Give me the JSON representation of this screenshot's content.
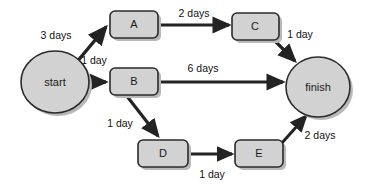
{
  "diagram": {
    "type": "activity-network-diagram",
    "title": "",
    "colors": {
      "node_fill": "#d2d2d2",
      "node_stroke": "#2b2b2b",
      "edge": "#232323",
      "shadow": "#b9b9b9",
      "background": "#ffffff",
      "text": "#1a1a1a"
    },
    "nodes": [
      {
        "id": "start",
        "label": "start",
        "shape": "ellipse",
        "cx": 55,
        "cy": 82,
        "rx": 34,
        "ry": 31
      },
      {
        "id": "A",
        "label": "A",
        "shape": "rounded-rect",
        "x": 110,
        "y": 11,
        "w": 48,
        "h": 27
      },
      {
        "id": "B",
        "label": "B",
        "shape": "rounded-rect",
        "x": 110,
        "y": 68,
        "w": 48,
        "h": 27
      },
      {
        "id": "C",
        "label": "C",
        "shape": "rounded-rect",
        "x": 232,
        "y": 13,
        "w": 47,
        "h": 27
      },
      {
        "id": "D",
        "label": "D",
        "shape": "rounded-rect",
        "x": 138,
        "y": 140,
        "w": 50,
        "h": 27
      },
      {
        "id": "E",
        "label": "E",
        "shape": "rounded-rect",
        "x": 235,
        "y": 140,
        "w": 48,
        "h": 27
      },
      {
        "id": "finish",
        "label": "finish",
        "shape": "ellipse",
        "cx": 318,
        "cy": 87,
        "rx": 32,
        "ry": 30
      }
    ],
    "edges": [
      {
        "id": "start-A",
        "from": "start",
        "to": "A",
        "label": "3 days",
        "label_x": 56,
        "label_y": 36
      },
      {
        "id": "start-B",
        "from": "start",
        "to": "B",
        "label": "1 day",
        "label_x": 94,
        "label_y": 61
      },
      {
        "id": "A-C",
        "from": "A",
        "to": "C",
        "label": "2 days",
        "label_x": 194,
        "label_y": 14
      },
      {
        "id": "C-finish",
        "from": "C",
        "to": "finish",
        "label": "1 day",
        "label_x": 300,
        "label_y": 35
      },
      {
        "id": "B-finish",
        "from": "B",
        "to": "finish",
        "label": "6 days",
        "label_x": 203,
        "label_y": 69
      },
      {
        "id": "B-D",
        "from": "B",
        "to": "D",
        "label": "1 day",
        "label_x": 120,
        "label_y": 124
      },
      {
        "id": "D-E",
        "from": "D",
        "to": "E",
        "label": "1 day",
        "label_x": 212,
        "label_y": 175
      },
      {
        "id": "E-finish",
        "from": "E",
        "to": "finish",
        "label": "2 days",
        "label_x": 320,
        "label_y": 136
      }
    ]
  }
}
